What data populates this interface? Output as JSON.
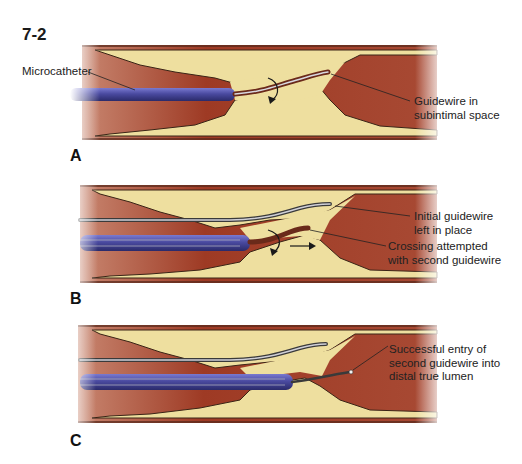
{
  "figure": {
    "number": "7-2",
    "colors": {
      "vessel_wall": "#c98a78",
      "vessel_edge": "#5a2a1c",
      "lumen": "#9e3a24",
      "plaque": "#eedf9f",
      "plaque_edge": "#3a2416",
      "catheter": "#4a4aa0",
      "catheter_highlight": "#8c8cd8",
      "wire": "#cfcfd6",
      "wire_edge": "#3a3a3a"
    },
    "panels": [
      {
        "label": "A",
        "callouts": [
          {
            "text": "Microcatheter"
          },
          {
            "text": "Guidewire in\nsubintimal space"
          }
        ]
      },
      {
        "label": "B",
        "callouts": [
          {
            "text": "Initial guidewire\nleft in place"
          },
          {
            "text": "Crossing attempted\nwith second guidewire"
          }
        ]
      },
      {
        "label": "C",
        "callouts": [
          {
            "text": "Successful entry of\nsecond guidewire into\ndistal true lumen"
          }
        ]
      }
    ]
  }
}
